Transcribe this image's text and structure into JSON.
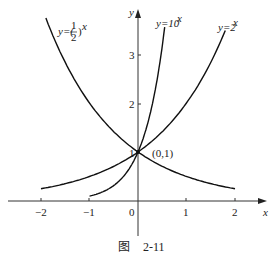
{
  "chart_data": {
    "type": "line",
    "title": "",
    "caption": "图 2-11",
    "xlabel": "x",
    "ylabel": "y",
    "xlim": [
      -2.5,
      2.5
    ],
    "ylim": [
      -0.9,
      3.9
    ],
    "x_ticks": [
      -2,
      -1,
      0,
      1,
      2
    ],
    "x_tick_labels": [
      "−2",
      "−1",
      "0",
      "1",
      "2"
    ],
    "y_ticks": [
      1,
      2,
      3
    ],
    "y_tick_labels": [
      "1",
      "2",
      "3"
    ],
    "grid": false,
    "series": [
      {
        "name": "y=(1/2)^x",
        "label": "y=(½)ˣ",
        "x_range": [
          -1.9,
          2.0
        ],
        "formula": "0.5^x"
      },
      {
        "name": "y=10^x",
        "label": "y=10ˣ",
        "x_range": [
          -1.0,
          0.55
        ],
        "formula": "10^x"
      },
      {
        "name": "y=2^x",
        "label": "y=2ˣ",
        "x_range": [
          -2.0,
          1.8
        ],
        "formula": "2^x"
      }
    ],
    "annotations": [
      {
        "text": "(0,1)",
        "x": 0,
        "y": 1
      }
    ]
  },
  "labels": {
    "y_axis": "y",
    "x_axis": "x",
    "origin": "0",
    "point": "(0,1)",
    "half_prefix": "y=(",
    "half_num": "1",
    "half_den": "2",
    "half_suffix": ")",
    "exp": "x",
    "ten": "y=10",
    "two": "y=2",
    "caption_fig": "图",
    "caption_num": "2-11",
    "xt": [
      "−2",
      "−1",
      "1",
      "2"
    ],
    "yt": [
      "1",
      "2",
      "3"
    ]
  }
}
